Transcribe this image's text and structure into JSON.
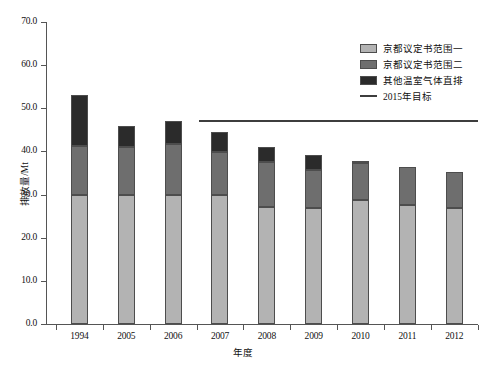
{
  "chart_data": {
    "type": "bar",
    "title": "",
    "xlabel": "年度",
    "ylabel": "排放量/Mt",
    "ylim": [
      0.0,
      70.0
    ],
    "ytick_labels": [
      "0.0",
      "10.0",
      "20.0",
      "30.0",
      "40.0",
      "50.0",
      "60.0",
      "70.0"
    ],
    "ytick_values": [
      0.0,
      10.0,
      20.0,
      30.0,
      40.0,
      50.0,
      60.0,
      70.0
    ],
    "grid": false,
    "stacked": true,
    "legend_position": "top-right",
    "categories": [
      "1994",
      "2005",
      "2006",
      "2007",
      "2008",
      "2009",
      "2010",
      "2011",
      "2012"
    ],
    "series": [
      {
        "name": "京都议定书范围一",
        "color": "#b3b3b3",
        "values": [
          30.0,
          29.8,
          29.8,
          30.0,
          27.2,
          26.8,
          28.8,
          27.5,
          27.0
        ]
      },
      {
        "name": "京都议定书范围二",
        "color": "#6e6e6e",
        "values": [
          11.3,
          11.3,
          12.0,
          9.9,
          10.3,
          8.9,
          8.5,
          9.0,
          8.3
        ]
      },
      {
        "name": "其他温室气体直排",
        "color": "#2b2b2b",
        "values": [
          11.7,
          4.9,
          5.2,
          4.5,
          3.5,
          3.5,
          0.6,
          0.0,
          0.0
        ]
      }
    ],
    "totals": [
      53.0,
      46.0,
      47.0,
      44.4,
      41.0,
      39.2,
      37.9,
      36.5,
      35.3
    ],
    "reference_line": {
      "name": "2015年目标",
      "value": 47.0,
      "color": "#3d3d3d",
      "start_category": "2007",
      "end_category": "2012"
    }
  },
  "legend": {
    "entries": [
      {
        "label": "京都议定书范围一",
        "kind": "swatch",
        "color": "#b3b3b3"
      },
      {
        "label": "京都议定书范围二",
        "kind": "swatch",
        "color": "#6e6e6e"
      },
      {
        "label": "其他温室气体直排",
        "kind": "swatch",
        "color": "#2b2b2b"
      },
      {
        "label": "2015年目标",
        "kind": "line",
        "color": "#3d3d3d"
      }
    ]
  }
}
